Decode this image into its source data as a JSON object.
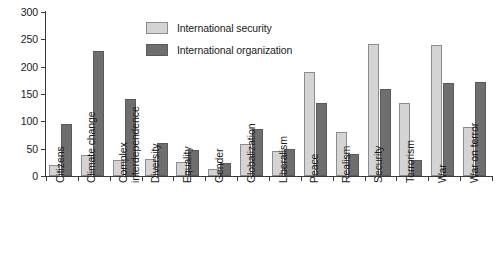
{
  "chart_data": {
    "type": "bar",
    "title": "",
    "xlabel": "",
    "ylabel": "",
    "ylim": [
      0,
      300
    ],
    "yticks": [
      0,
      50,
      100,
      150,
      200,
      250,
      300
    ],
    "grid": false,
    "legend_position": "top-center",
    "categories": [
      "Citizens",
      "Climate change",
      "Complex interdependence",
      "Diversity",
      "Equality",
      "Gender",
      "Globalization",
      "Liberalism",
      "Peace",
      "Realism",
      "Security",
      "Terrorism",
      "War",
      "War on terror"
    ],
    "category_lines": [
      [
        "Citizens"
      ],
      [
        "Climate change"
      ],
      [
        "Complex",
        "interdependence"
      ],
      [
        "Diversity"
      ],
      [
        "Equality"
      ],
      [
        "Gender"
      ],
      [
        "Globalization"
      ],
      [
        "Liberalism"
      ],
      [
        "Peace"
      ],
      [
        "Realism"
      ],
      [
        "Security"
      ],
      [
        "Terrorism"
      ],
      [
        "War"
      ],
      [
        "War on terror"
      ]
    ],
    "series": [
      {
        "name": "International security",
        "color": "#d4d4d4",
        "values": [
          20,
          39,
          30,
          32,
          25,
          12,
          58,
          45,
          191,
          81,
          242,
          133,
          239,
          90
        ]
      },
      {
        "name": "International organization",
        "color": "#6e6e6e",
        "values": [
          95,
          228,
          141,
          60,
          47,
          24,
          86,
          50,
          133,
          40,
          159,
          30,
          171,
          172
        ]
      }
    ]
  },
  "legend": {
    "items": [
      {
        "label": "International security"
      },
      {
        "label": "International organization"
      }
    ]
  }
}
